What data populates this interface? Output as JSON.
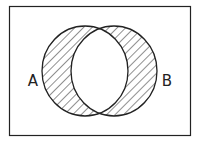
{
  "diagram": {
    "type": "venn",
    "shaded_region": "A symmetric-difference B",
    "universe": {
      "x": 9,
      "y": 6,
      "width": 182,
      "height": 130
    },
    "sets": [
      {
        "name": "A",
        "label": "A",
        "cx": 85,
        "cy": 71,
        "rx": 43,
        "ry": 45,
        "label_x": 33,
        "label_y": 86
      },
      {
        "name": "B",
        "label": "B",
        "cx": 114,
        "cy": 71,
        "rx": 43,
        "ry": 45,
        "label_x": 167,
        "label_y": 86
      }
    ],
    "colors": {
      "stroke": "#222222",
      "hatch": "#333333",
      "background": "#ffffff"
    },
    "hatch": {
      "angle": 45,
      "spacing": 6
    }
  }
}
